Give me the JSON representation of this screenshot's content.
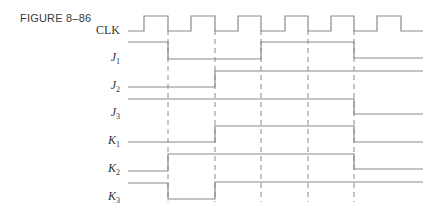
{
  "figure": {
    "label": "FIGURE 8–86"
  },
  "signals": [
    {
      "name": "CLK",
      "label": "CLK",
      "sub": ""
    },
    {
      "name": "J1",
      "label": "J",
      "sub": "1"
    },
    {
      "name": "J2",
      "label": "J",
      "sub": "2"
    },
    {
      "name": "J3",
      "label": "J",
      "sub": "3"
    },
    {
      "name": "K1",
      "label": "K",
      "sub": "1"
    },
    {
      "name": "K2",
      "label": "K",
      "sub": "2"
    },
    {
      "name": "K3",
      "label": "K",
      "sub": "3"
    }
  ],
  "timing": {
    "clock_pulses": 6,
    "clock_falling_edges_marked": 5,
    "x_start": 128,
    "x_end": 423,
    "falling_edges_x": [
      168,
      215,
      261,
      308,
      354
    ],
    "waveforms": {
      "CLK": "0-1-0-1-0-1-0-1-0-1-0-1-0 (6 pulses)",
      "J1": [
        "1",
        "0",
        "0",
        "1",
        "1",
        "0"
      ],
      "J2": [
        "0",
        "0",
        "1",
        "1",
        "1",
        "1"
      ],
      "J3": [
        "1",
        "1",
        "1",
        "1",
        "1",
        "0"
      ],
      "K1": [
        "0",
        "0",
        "1",
        "1",
        "1",
        "0"
      ],
      "K2": [
        "0",
        "1",
        "1",
        "1",
        "1",
        "0"
      ],
      "K3": [
        "1",
        "0",
        "1",
        "1",
        "1",
        "1"
      ]
    }
  },
  "colors": {
    "line": "#8a8a8a",
    "text": "#333333",
    "background": "#ffffff"
  }
}
